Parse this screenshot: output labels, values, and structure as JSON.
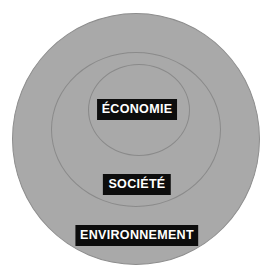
{
  "diagram": {
    "type": "nested-concentric-circles",
    "title": "",
    "background_color": "#ffffff",
    "fill_color": "#a9a9a9",
    "border_color": "#8a8a8a",
    "label_background_color": "#0d0d0d",
    "label_text_color": "#ffffff",
    "levels": [
      {
        "id": "environnement",
        "label": "ENVIRONNEMENT",
        "rank": 3,
        "position": "outer"
      },
      {
        "id": "societe",
        "label": "SOCIÉTÉ",
        "rank": 2,
        "position": "middle"
      },
      {
        "id": "economie",
        "label": "ÉCONOMIE",
        "rank": 1,
        "position": "inner"
      }
    ]
  }
}
